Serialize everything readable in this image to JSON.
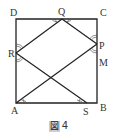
{
  "figure": {
    "caption_prefix": "図",
    "caption_number": "4",
    "points": {
      "D": {
        "label": "D",
        "x": 16,
        "y": 19
      },
      "C": {
        "label": "C",
        "x": 97,
        "y": 19
      },
      "B": {
        "label": "B",
        "x": 97,
        "y": 103
      },
      "A": {
        "label": "A",
        "x": 16,
        "y": 103
      },
      "Q": {
        "label": "Q",
        "x": 62,
        "y": 19
      },
      "P": {
        "label": "P",
        "x": 97,
        "y": 44
      },
      "M": {
        "label": "M",
        "x": 97,
        "y": 62
      },
      "R": {
        "label": "R",
        "x": 16,
        "y": 53
      },
      "S": {
        "label": "S",
        "x": 87,
        "y": 103
      }
    },
    "segments": [
      "D-C",
      "C-B",
      "B-A",
      "A-D",
      "R-Q",
      "Q-P",
      "R-S",
      "A-P"
    ],
    "colors": {
      "stroke": "#222222",
      "label": "#333333"
    }
  }
}
